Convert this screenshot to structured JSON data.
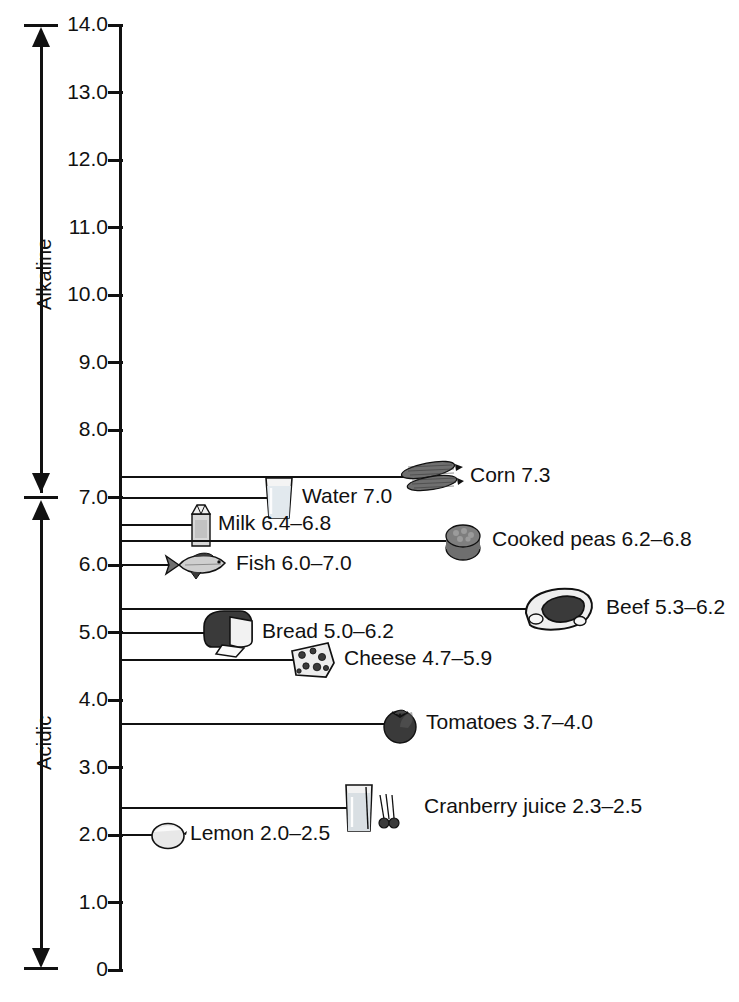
{
  "chart_data": {
    "type": "scatter",
    "title": "",
    "xlabel": "",
    "ylabel": "pH",
    "ylim": [
      0,
      14
    ],
    "grid": false,
    "legend": null,
    "orientation": "vertical-scale",
    "axis_ticks": [
      "14.0",
      "13.0",
      "12.0",
      "11.0",
      "10.0",
      "9.0",
      "8.0",
      "7.0",
      "6.0",
      "5.0",
      "4.0",
      "3.0",
      "2.0",
      "1.0",
      "0"
    ],
    "axis_tick_values": [
      14.0,
      13.0,
      12.0,
      11.0,
      10.0,
      9.0,
      8.0,
      7.0,
      6.0,
      5.0,
      4.0,
      3.0,
      2.0,
      1.0,
      0
    ],
    "direction_labels": [
      {
        "name": "alkaline",
        "text": "Alkaline",
        "range": [
          7.0,
          14.0
        ]
      },
      {
        "name": "acidic",
        "text": "Acidic",
        "range": [
          0,
          7.0
        ]
      }
    ],
    "neutral_point": 7.0,
    "categories": [
      "Corn",
      "Water",
      "Milk",
      "Cooked peas",
      "Fish",
      "Beef",
      "Bread",
      "Cheese",
      "Tomatoes",
      "Cranberry juice",
      "Lemon"
    ],
    "values": [
      7.3,
      7.0,
      6.6,
      6.5,
      6.0,
      5.75,
      5.6,
      5.35,
      3.85,
      2.4,
      2.25
    ],
    "items": [
      {
        "name": "corn",
        "label": "Corn 7.3",
        "ph_text": "7.3",
        "ph_low": 7.3,
        "ph_high": 7.3,
        "leader_ph": 7.3,
        "icon": "corn-icon",
        "icon_x": 398,
        "icon_w": 66,
        "label_x": 470
      },
      {
        "name": "water",
        "label": "Water 7.0",
        "ph_text": "7.0",
        "ph_low": 7.0,
        "ph_high": 7.0,
        "leader_ph": 7.0,
        "icon": "water-glass-icon",
        "icon_x": 262,
        "icon_w": 34,
        "label_x": 302
      },
      {
        "name": "milk",
        "label": "Milk 6.4–6.8",
        "ph_text": "6.4–6.8",
        "ph_low": 6.4,
        "ph_high": 6.8,
        "leader_ph": 6.6,
        "icon": "milk-carton-icon",
        "icon_x": 188,
        "icon_w": 26,
        "label_x": 218
      },
      {
        "name": "cooked-peas",
        "label": "Cooked peas 6.2–6.8",
        "ph_text": "6.2–6.8",
        "ph_low": 6.2,
        "ph_high": 6.8,
        "leader_ph": 6.35,
        "icon": "peas-bowl-icon",
        "icon_x": 438,
        "icon_w": 50,
        "label_x": 492
      },
      {
        "name": "fish",
        "label": "Fish 6.0–7.0",
        "ph_text": "6.0–7.0",
        "ph_low": 6.0,
        "ph_high": 7.0,
        "leader_ph": 6.0,
        "icon": "fish-icon",
        "icon_x": 163,
        "icon_w": 68,
        "label_x": 236
      },
      {
        "name": "beef",
        "label": "Beef 5.3–6.2",
        "ph_text": "5.3–6.2",
        "ph_low": 5.3,
        "ph_high": 6.2,
        "leader_ph": 5.35,
        "icon": "beef-steak-icon",
        "icon_x": 516,
        "icon_w": 84,
        "label_x": 606
      },
      {
        "name": "bread",
        "label": "Bread 5.0–6.2",
        "ph_text": "5.0–6.2",
        "ph_low": 5.0,
        "ph_high": 6.2,
        "leader_ph": 5.0,
        "icon": "bread-loaf-icon",
        "icon_x": 200,
        "icon_w": 58,
        "label_x": 262
      },
      {
        "name": "cheese",
        "label": "Cheese 4.7–5.9",
        "ph_text": "4.7–5.9",
        "ph_low": 4.7,
        "ph_high": 5.9,
        "leader_ph": 4.6,
        "icon": "cheese-wedge-icon",
        "icon_x": 286,
        "icon_w": 52,
        "label_x": 344
      },
      {
        "name": "tomatoes",
        "label": "Tomatoes 3.7–4.0",
        "ph_text": "3.7–4.0",
        "ph_low": 3.7,
        "ph_high": 4.0,
        "leader_ph": 3.65,
        "icon": "tomato-icon",
        "icon_x": 378,
        "icon_w": 44,
        "label_x": 426
      },
      {
        "name": "cranberry-juice",
        "label": "Cranberry juice 2.3–2.5",
        "ph_text": "2.3–2.5",
        "ph_low": 2.3,
        "ph_high": 2.5,
        "leader_ph": 2.4,
        "icon": "cranberry-juice-icon",
        "icon_x": 340,
        "icon_w": 66,
        "label_x": 424
      },
      {
        "name": "lemon",
        "label": "Lemon 2.0–2.5",
        "ph_text": "2.0–2.5",
        "ph_low": 2.0,
        "ph_high": 2.5,
        "leader_ph": 2.0,
        "icon": "lemon-icon",
        "icon_x": 148,
        "icon_w": 40,
        "label_x": 190
      }
    ]
  }
}
